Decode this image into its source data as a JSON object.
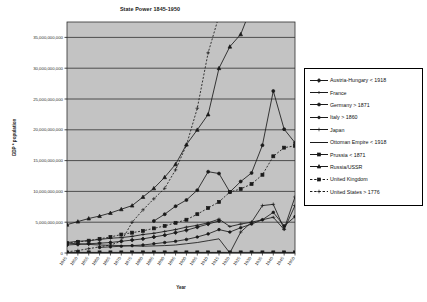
{
  "chart_data": {
    "type": "line",
    "title": "State Power 1845-1950",
    "xlabel": "Year",
    "ylabel": "GDP * population",
    "ylim": [
      0,
      37500000000
    ],
    "yticks": [
      0,
      5000000000,
      10000000000,
      15000000000,
      20000000000,
      25000000000,
      30000000000,
      35000000000
    ],
    "ytick_labels": [
      "0",
      "5,000,000,000",
      "10,000,000,000",
      "15,000,000,000",
      "20,000,000,000",
      "25,000,000,000",
      "30,000,000,000",
      "35,000,000,000"
    ],
    "grid": true,
    "legend_position": "right",
    "categories": [
      1845,
      1850,
      1855,
      1860,
      1865,
      1870,
      1875,
      1880,
      1885,
      1890,
      1895,
      1900,
      1905,
      1910,
      1915,
      1920,
      1925,
      1930,
      1935,
      1940,
      1945,
      1950
    ],
    "xtick_labels": [
      "1845",
      "1850",
      "1855",
      "1860",
      "1865",
      "1870",
      "1875",
      "1880",
      "1885",
      "1890",
      "1895",
      "1900",
      "1905",
      "1910",
      "1915",
      "1920",
      "1925",
      "1930",
      "1935",
      "1940",
      "1945",
      "1950"
    ],
    "series": [
      {
        "name": "Austria-Hungary < 1918",
        "marker": "diamond",
        "dash": "solid",
        "values": [
          1300000000,
          1400000000,
          1500000000,
          1600000000,
          1700000000,
          1900000000,
          2100000000,
          2300000000,
          2600000000,
          2900000000,
          3300000000,
          3700000000,
          4200000000,
          4700000000,
          5200000000,
          null,
          null,
          null,
          null,
          null,
          null,
          null
        ]
      },
      {
        "name": "France",
        "marker": "cross-bar",
        "dash": "solid",
        "values": [
          1700000000,
          1900000000,
          2000000000,
          2200000000,
          2400000000,
          2500000000,
          2700000000,
          3000000000,
          3200000000,
          3500000000,
          3800000000,
          4200000000,
          4500000000,
          4900000000,
          5500000000,
          4300000000,
          4700000000,
          5000000000,
          5400000000,
          5800000000,
          3800000000,
          7700000000
        ]
      },
      {
        "name": "Germany > 1871",
        "marker": "circle",
        "dash": "solid",
        "values": [
          null,
          null,
          null,
          null,
          null,
          null,
          null,
          null,
          5200000000,
          6300000000,
          7600000000,
          8600000000,
          10200000000,
          13200000000,
          12900000000,
          9900000000,
          11600000000,
          13000000000,
          17500000000,
          26300000000,
          20100000000,
          17900000000
        ]
      },
      {
        "name": "Italy > 1860",
        "marker": "circle-small",
        "dash": "solid",
        "values": [
          null,
          null,
          null,
          900000000,
          1000000000,
          1100000000,
          1200000000,
          1300000000,
          1500000000,
          1700000000,
          1900000000,
          2200000000,
          2600000000,
          3100000000,
          3800000000,
          3400000000,
          4100000000,
          4700000000,
          5400000000,
          6600000000,
          4400000000,
          5900000000
        ]
      },
      {
        "name": "Japan",
        "marker": "plus",
        "dash": "solid",
        "values": [
          0,
          0,
          0,
          0,
          0,
          0,
          0,
          0,
          0,
          0,
          0,
          0,
          0,
          0,
          0,
          0,
          3400000000,
          5000000000,
          7700000000,
          7900000000,
          3900000000,
          9100000000
        ]
      },
      {
        "name": "Ottoman Empire < 1918",
        "marker": "none",
        "dash": "solid",
        "values": [
          1600000000,
          1500000000,
          1400000000,
          1300000000,
          1250000000,
          1200000000,
          1150000000,
          1100000000,
          1150000000,
          1200000000,
          1300000000,
          1500000000,
          1700000000,
          2000000000,
          2300000000,
          0,
          null,
          null,
          null,
          null,
          null,
          null
        ]
      },
      {
        "name": "Prussia < 1871",
        "marker": "square",
        "dash": "solid",
        "values": [
          100000000,
          100000000,
          100000000,
          100000000,
          100000000,
          100000000,
          100000000,
          100000000,
          100000000,
          100000000,
          100000000,
          100000000,
          100000000,
          100000000,
          100000000,
          100000000,
          100000000,
          100000000,
          100000000,
          100000000,
          100000000,
          100000000
        ]
      },
      {
        "name": "Russia/USSR",
        "marker": "triangle",
        "dash": "solid",
        "values": [
          4600000000,
          5100000000,
          5600000000,
          6000000000,
          6500000000,
          7100000000,
          7700000000,
          9100000000,
          10500000000,
          12300000000,
          14400000000,
          17600000000,
          20000000000,
          22500000000,
          30000000000,
          33500000000,
          35500000000,
          40000000000,
          null,
          null,
          null,
          null
        ]
      },
      {
        "name": "United Kingdom",
        "marker": "square",
        "dash": "dashed",
        "values": [
          1600000000,
          1800000000,
          2000000000,
          2300000000,
          2600000000,
          3000000000,
          3300000000,
          3600000000,
          4000000000,
          4400000000,
          4900000000,
          5400000000,
          6300000000,
          7300000000,
          8300000000,
          9900000000,
          10400000000,
          11200000000,
          12700000000,
          15700000000,
          17100000000,
          17400000000
        ]
      },
      {
        "name": "United States > 1776",
        "marker": "plus",
        "dash": "dashed",
        "values": [
          200000000,
          400000000,
          700000000,
          1000000000,
          1300000000,
          1900000000,
          5000000000,
          7000000000,
          8800000000,
          10500000000,
          13500000000,
          17500000000,
          23500000000,
          32500000000,
          38500000000,
          null,
          null,
          null,
          null,
          null,
          null,
          null
        ]
      }
    ]
  },
  "legend": {
    "items": [
      {
        "label": "Austria-Hungary < 1918"
      },
      {
        "label": "France"
      },
      {
        "label": "Germany > 1871"
      },
      {
        "label": "Italy > 1860"
      },
      {
        "label": "Japan"
      },
      {
        "label": "Ottoman Empire < 1918"
      },
      {
        "label": "Prussia < 1871"
      },
      {
        "label": "Russia/USSR"
      },
      {
        "label": "United Kingdom"
      },
      {
        "label": "United States > 1776"
      }
    ]
  },
  "colors": {
    "plot_background": "#c3c3c3",
    "page_background": "#ffffff",
    "line": "#1a1a1a",
    "grid": "#2e2e2e",
    "legend_background": "#ffffff",
    "legend_border": "#000000"
  }
}
